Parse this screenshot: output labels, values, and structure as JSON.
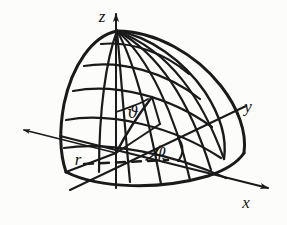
{
  "figure": {
    "background_color": "#fcfcfb",
    "ink_color": "#1a1a1a",
    "axes": [
      {
        "name": "z",
        "label": "z",
        "direction": "up",
        "arrow": true
      },
      {
        "name": "x",
        "label": "x",
        "direction": "lower-right",
        "arrow": true
      },
      {
        "name": "y",
        "label": "y",
        "direction": "upper-right",
        "arrow": false
      },
      {
        "name": "y-negative",
        "label": "",
        "direction": "upper-left",
        "arrow": true
      }
    ],
    "labels": {
      "z_axis": "z",
      "x_axis": "x",
      "y_axis": "y",
      "radius": "r",
      "polar_angle": "ϑ",
      "azimuth_angle": "φ"
    },
    "annotations": {
      "polar_angle_name": "theta-vartheta",
      "azimuth_angle_name": "phi-varphi",
      "radius_name": "r",
      "dashed_reference": "azimuth-reference-direction"
    },
    "surface": {
      "type": "hemisphere-octant-shell",
      "latitude_lines": 5,
      "longitude_lines": 7,
      "has_dashed_reference_arrow": true
    }
  }
}
